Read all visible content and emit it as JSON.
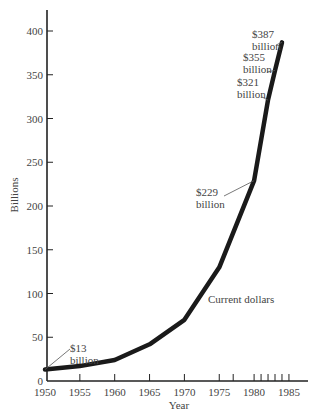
{
  "chart_data": {
    "type": "line",
    "title": "",
    "xlabel": "Year",
    "ylabel": "Billions",
    "ylim": [
      0,
      400
    ],
    "xlim": [
      1950,
      1988
    ],
    "grid": false,
    "legend": null,
    "x_ticks": [
      1950,
      1955,
      1960,
      1965,
      1970,
      1975,
      1977,
      1980,
      1981,
      1982,
      1983,
      1984,
      1985
    ],
    "x_tick_labels": [
      "1950",
      "1955",
      "1960",
      "1965",
      "1970",
      "1975",
      "1980",
      "1985"
    ],
    "y_ticks": [
      0,
      50,
      100,
      150,
      200,
      250,
      300,
      350,
      400
    ],
    "y_tick_labels": [
      "0",
      "50",
      "100",
      "150",
      "200",
      "250",
      "300",
      "350",
      "400"
    ],
    "series": [
      {
        "name": "Current dollars",
        "x": [
          1950,
          1955,
          1960,
          1965,
          1970,
          1975,
          1980,
          1982,
          1983,
          1984
        ],
        "values": [
          13,
          17,
          24,
          42,
          70,
          130,
          229,
          321,
          355,
          387
        ]
      }
    ],
    "annotations": [
      {
        "text_line1": "$13",
        "text_line2": "billion",
        "x": 1950,
        "y": 13
      },
      {
        "text_line1": "$229",
        "text_line2": "billion",
        "x": 1980,
        "y": 229
      },
      {
        "text_line1": "$321",
        "text_line2": "billion",
        "x": 1982,
        "y": 321
      },
      {
        "text_line1": "$355",
        "text_line2": "billion",
        "x": 1983,
        "y": 355
      },
      {
        "text_line1": "$387",
        "text_line2": "billion",
        "x": 1984,
        "y": 387
      }
    ],
    "series_label": "Current dollars"
  },
  "colors": {
    "line": "#1a1a1a",
    "axis": "#222222",
    "text": "#444444"
  }
}
